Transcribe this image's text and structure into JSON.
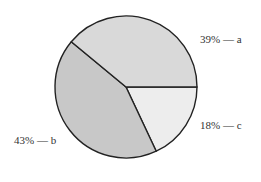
{
  "chart_data": {
    "type": "pie",
    "title": "",
    "slices": [
      {
        "label": "a",
        "value": 39,
        "text": "39% — a",
        "color": "#d9d9d9"
      },
      {
        "label": "c",
        "value": 18,
        "text": "18% — c",
        "color": "#ededed"
      },
      {
        "label": "b",
        "value": 43,
        "text": "43% — b",
        "color": "#c8c8c8"
      }
    ],
    "categories": [
      "a",
      "b",
      "c"
    ],
    "values": [
      39,
      43,
      18
    ],
    "legend": "none (inline labels)",
    "stroke_color": "#222222"
  },
  "labels": {
    "a": "39% — a",
    "b": "43% — b",
    "c": "18% — c"
  }
}
